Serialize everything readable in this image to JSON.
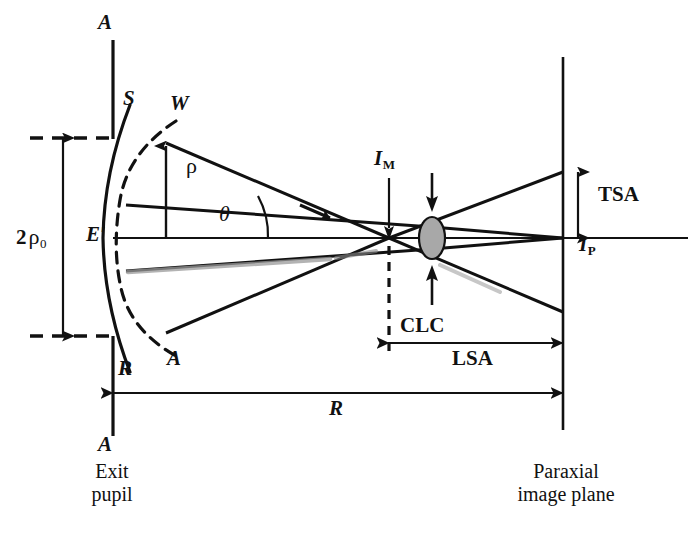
{
  "figure": {
    "domain": "diagram",
    "background_color": "#ffffff",
    "ink_color": "#111111",
    "clc_fill_color": "#a8a8a8"
  },
  "labels": {
    "aperture_top": "A",
    "aperture_bottom": "A",
    "reference_sphere": "S",
    "wavefront": "W",
    "wavefront_lower": "W",
    "ray_lower": "A",
    "ray_label_R": "R",
    "edge_point": "E",
    "edge_point_prime": "′",
    "rho": "ρ",
    "theta": "θ",
    "aperture_diameter_prefix": "2",
    "aperture_diameter_symbol": "ρ",
    "aperture_diameter_sub": "0",
    "marginal_image": "I",
    "marginal_image_sub": "M",
    "paraxial_image": "I",
    "paraxial_image_sub": "P",
    "circle_least_confusion": "CLC",
    "transverse_aberration": "TSA",
    "longitudinal_aberration": "LSA",
    "radius": "R",
    "exit_pupil_line1": "Exit",
    "exit_pupil_line2": "pupil",
    "image_plane_line1": "Paraxial",
    "image_plane_line2": "image plane"
  },
  "geometry": {
    "optical_axis_y": 238,
    "exit_pupil_x": 113,
    "image_plane_x": 563,
    "marginal_focus_x": 389,
    "clc_center_x": 432,
    "clc_rx": 13,
    "clc_ry": 21,
    "aperture_half_height": 99,
    "tsa_top_y": 172,
    "tsa_bottom_y": 238,
    "lsa_left_x": 389,
    "lsa_right_x": 563,
    "radius_left_x": 113,
    "radius_right_x": 563
  },
  "annotations": {
    "dimension_2rho0": {
      "label": "2ρ₀",
      "from_y": 138,
      "to_y": 336,
      "x": 63
    },
    "dimension_TSA": {
      "label": "TSA",
      "from_y": 172,
      "to_y": 238,
      "x": 578
    },
    "dimension_LSA": {
      "label": "LSA",
      "from_x": 389,
      "to_x": 563,
      "y": 343
    },
    "dimension_R": {
      "label": "R",
      "from_x": 113,
      "to_x": 563,
      "y": 393
    }
  }
}
